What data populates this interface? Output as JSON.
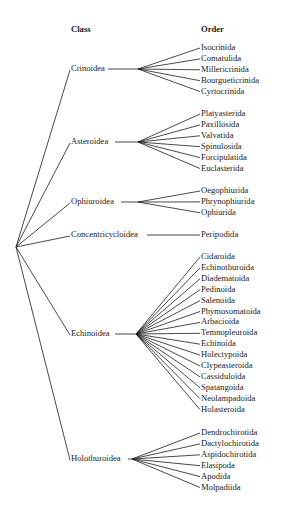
{
  "headers": {
    "class": "Class",
    "order": "Order"
  },
  "colors": {
    "line": "#1a1a1a",
    "background": "#ffffff"
  },
  "root": {
    "x": 16,
    "y": 247
  },
  "classes": [
    {
      "name": "Crinoidea",
      "y": 68,
      "node_x": 138,
      "line_start": 108,
      "orders": [
        "Isocrinida",
        "Comatulida",
        "Millericrinida",
        "Bourgueticrinida",
        "Cyrtocrinida"
      ],
      "order_y0": 47
    },
    {
      "name": "Asteroidea",
      "y": 141,
      "node_x": 138,
      "line_start": 115,
      "orders": [
        "Platyasterida",
        "Paxillosida",
        "Valvatida",
        "Spinulosida",
        "Forcipulatida",
        "Euclasterida"
      ],
      "order_y0": 113
    },
    {
      "name": "Ophiuroidea",
      "y": 201,
      "node_x": 138,
      "line_start": 121,
      "orders": [
        "Oegophiurida",
        "Phrynophiurida",
        "Ophiurida"
      ],
      "order_y0": 190
    },
    {
      "name": "Concentricycloidea",
      "y": 234,
      "node_x": 200,
      "line_start": 147,
      "orders": [
        "Peripodida"
      ],
      "order_y0": 234
    },
    {
      "name": "Echinoidea",
      "y": 333,
      "node_x": 136,
      "line_start": 115,
      "orders": [
        "Cidaroida",
        "Echinothuroida",
        "Diadematoida",
        "Pedinoida",
        "Salenoida",
        "Phymosomatoida",
        "Arbacioida",
        "Temnopleuroida",
        "Echinoida",
        "Holectypoida",
        "Clypeasteroida",
        "Cassiduloida",
        "Spatangoida",
        "Neolampadoida",
        "Holasteroida"
      ],
      "order_y0": 256
    },
    {
      "name": "Holothuroidea",
      "y": 458,
      "node_x": 132,
      "line_start": 128,
      "orders": [
        "Dendrochirotida",
        "Dactylochirotida",
        "Aspidochirotida",
        "Elasipoda",
        "Apodida",
        "Molpadiida"
      ],
      "order_y0": 432
    }
  ],
  "layout": {
    "class_x": 71,
    "order_x": 201,
    "order_step": 10.9,
    "header_y": 29
  }
}
